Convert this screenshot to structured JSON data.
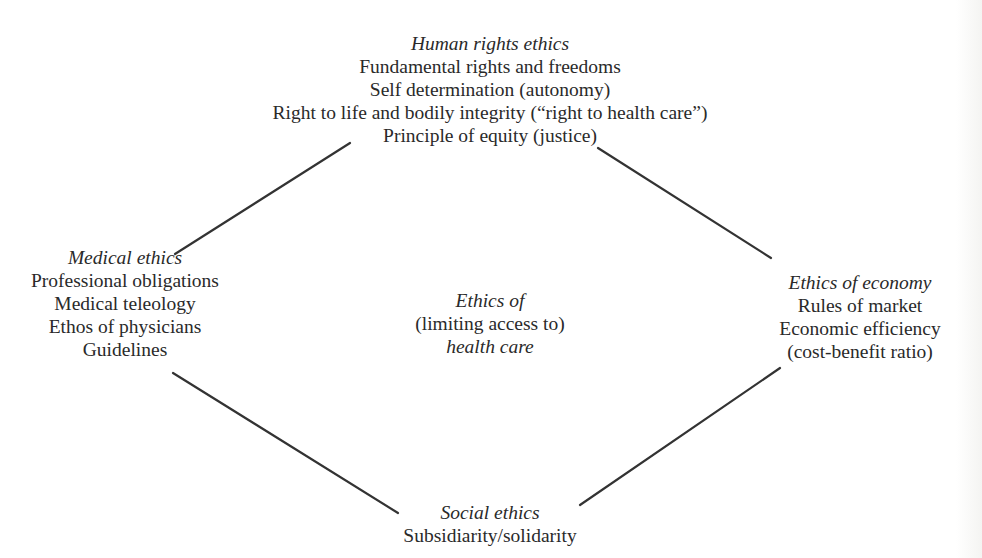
{
  "diagram": {
    "type": "diamond-concept-map",
    "center": {
      "lines": [
        {
          "text": "Ethics of",
          "italic": true
        },
        {
          "text": "(limiting access to)",
          "italic": false
        },
        {
          "text": "health care",
          "italic": true
        }
      ]
    },
    "top": {
      "title": "Human rights ethics",
      "items": [
        "Fundamental rights and freedoms",
        "Self determination (autonomy)",
        "Right to life and bodily integrity (“right to health care”)",
        "Principle of equity (justice)"
      ]
    },
    "left": {
      "title": "Medical ethics",
      "items": [
        "Professional obligations",
        "Medical teleology",
        "Ethos of physicians",
        "Guidelines"
      ]
    },
    "right": {
      "title": "Ethics of economy",
      "items": [
        "Rules of market",
        "Economic efficiency",
        "(cost-benefit ratio)"
      ]
    },
    "bottom": {
      "title": "Social ethics",
      "items": [
        "Subsidiarity/solidarity"
      ]
    },
    "connectors": [
      {
        "from": "left",
        "to": "top",
        "x1": 175,
        "y1": 254,
        "x2": 350,
        "y2": 143
      },
      {
        "from": "top",
        "to": "right",
        "x1": 598,
        "y1": 148,
        "x2": 771,
        "y2": 258
      },
      {
        "from": "left",
        "to": "bottom",
        "x1": 173,
        "y1": 373,
        "x2": 398,
        "y2": 513
      },
      {
        "from": "bottom",
        "to": "right",
        "x1": 580,
        "y1": 505,
        "x2": 780,
        "y2": 368
      }
    ],
    "colors": {
      "text": "#2a2a2a",
      "line": "#333333",
      "background": "#ffffff"
    }
  }
}
